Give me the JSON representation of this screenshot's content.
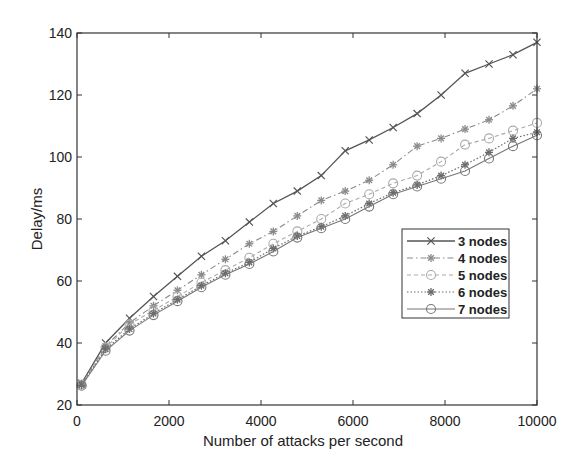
{
  "chart_data": {
    "type": "line",
    "title": "",
    "xlabel": "Number of attacks per second",
    "ylabel": "Delay/ms",
    "xlim": [
      0,
      10000
    ],
    "ylim": [
      20,
      140
    ],
    "xticks": [
      0,
      2000,
      4000,
      6000,
      8000,
      10000
    ],
    "yticks": [
      20,
      40,
      60,
      80,
      100,
      120,
      140
    ],
    "grid": false,
    "legend_position": "inside-right-middle",
    "x": [
      100,
      621,
      1142,
      1663,
      2184,
      2705,
      3226,
      3747,
      4268,
      4789,
      5310,
      5831,
      6352,
      6873,
      7394,
      7915,
      8436,
      8957,
      9478,
      10000
    ],
    "series": [
      {
        "name": "3 nodes",
        "marker": "x",
        "dash": "solid",
        "values": [
          27,
          40,
          48,
          55,
          61.5,
          68,
          73,
          79,
          85,
          89,
          94,
          102,
          105.5,
          109.5,
          114,
          120,
          127,
          130,
          133,
          137
        ]
      },
      {
        "name": "4 nodes",
        "marker": "*",
        "dash": "dashdot",
        "values": [
          26.8,
          39,
          46.5,
          52,
          57,
          62,
          67,
          72,
          76,
          81,
          86,
          89,
          92.5,
          97.5,
          103.5,
          106,
          109,
          112,
          116.5,
          122
        ]
      },
      {
        "name": "5 nodes",
        "marker": "o",
        "dash": "dashed",
        "values": [
          26.6,
          38.5,
          46,
          50.5,
          55,
          59.5,
          63.5,
          67.5,
          72,
          76,
          80,
          85,
          88,
          91.5,
          94,
          98.5,
          104,
          106,
          108.5,
          111
        ]
      },
      {
        "name": "6 nodes",
        "marker": "*",
        "dash": "dotted",
        "values": [
          26.4,
          38,
          44.5,
          49.5,
          54,
          58.5,
          62.5,
          66,
          70.5,
          74.5,
          77.5,
          81,
          85,
          88.5,
          91,
          94,
          97.5,
          101.5,
          106,
          108
        ]
      },
      {
        "name": "7 nodes",
        "marker": "o",
        "dash": "solid",
        "values": [
          26.2,
          37.5,
          44,
          49,
          53.5,
          58,
          62,
          65.5,
          69.5,
          74,
          77,
          80,
          84,
          88,
          90.5,
          93,
          95.5,
          99.5,
          103.5,
          107
        ]
      }
    ]
  },
  "axes": {
    "xlabel": "Number of attacks per second",
    "ylabel": "Delay/ms",
    "xtick_labels": [
      "0",
      "2000",
      "4000",
      "6000",
      "8000",
      "10000"
    ],
    "ytick_labels": [
      "20",
      "40",
      "60",
      "80",
      "100",
      "120",
      "140"
    ]
  },
  "legend": {
    "items": [
      {
        "label": "3 nodes"
      },
      {
        "label": "4 nodes"
      },
      {
        "label": "5 nodes"
      },
      {
        "label": "6 nodes"
      },
      {
        "label": "7 nodes"
      }
    ]
  },
  "colors": {
    "axis": "#333333",
    "s3": "#555555",
    "s4": "#8a8a8a",
    "s5": "#aaaaaa",
    "s6": "#6a6a6a",
    "s7": "#777777"
  }
}
